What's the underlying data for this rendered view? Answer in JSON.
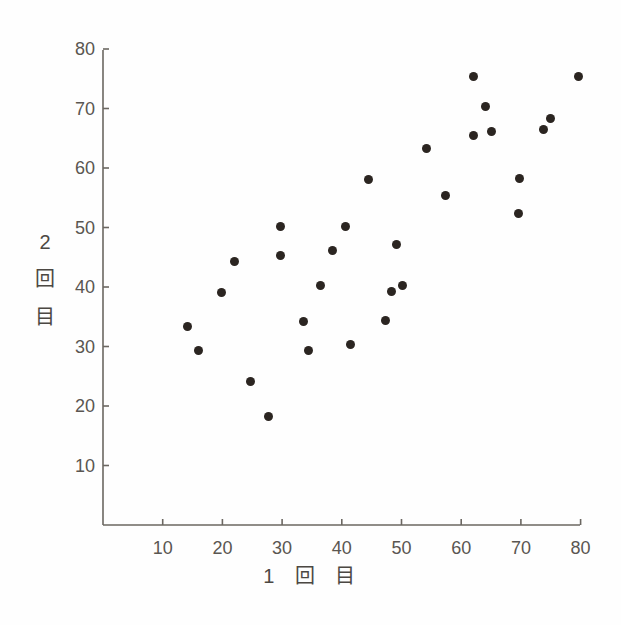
{
  "chart_data": {
    "type": "scatter",
    "title": "",
    "subtitle": "",
    "xlabel": "1 回 目",
    "ylabel": "2 回 目",
    "xlabel_segments": [
      "1",
      "回",
      "目"
    ],
    "ylabel_segments": [
      "2",
      "回",
      "目"
    ],
    "xlim": [
      0,
      82
    ],
    "ylim": [
      0,
      82
    ],
    "xticks": [
      10,
      20,
      30,
      40,
      50,
      60,
      70,
      80
    ],
    "yticks": [
      10,
      20,
      30,
      40,
      50,
      60,
      70,
      80
    ],
    "xticklabels": [
      "10",
      "20",
      "30",
      "40",
      "50",
      "60",
      "70",
      "80"
    ],
    "yticklabels": [
      "10",
      "20",
      "30",
      "40",
      "50",
      "60",
      "70",
      "80"
    ],
    "grid": false,
    "legend": false,
    "legend_position": "none",
    "marker": "circle",
    "marker_color": "#2b2521",
    "marker_size": 9,
    "axis_color": "#6b6761",
    "tick_label_color": "#5a5651",
    "background_color": "#fefefe",
    "n_points": 30,
    "points": [
      {
        "x": 14.1,
        "y": 33.4
      },
      {
        "x": 16.0,
        "y": 29.4
      },
      {
        "x": 19.8,
        "y": 39.1
      },
      {
        "x": 22.0,
        "y": 44.3
      },
      {
        "x": 24.7,
        "y": 24.2
      },
      {
        "x": 27.7,
        "y": 18.3
      },
      {
        "x": 29.7,
        "y": 50.2
      },
      {
        "x": 29.8,
        "y": 45.3
      },
      {
        "x": 33.6,
        "y": 34.2
      },
      {
        "x": 34.4,
        "y": 29.3
      },
      {
        "x": 36.4,
        "y": 40.2
      },
      {
        "x": 38.5,
        "y": 46.2
      },
      {
        "x": 40.7,
        "y": 50.2
      },
      {
        "x": 41.4,
        "y": 30.3
      },
      {
        "x": 44.4,
        "y": 58.1
      },
      {
        "x": 47.3,
        "y": 34.3
      },
      {
        "x": 49.1,
        "y": 47.2
      },
      {
        "x": 48.3,
        "y": 39.2
      },
      {
        "x": 50.1,
        "y": 40.3
      },
      {
        "x": 54.2,
        "y": 63.3
      },
      {
        "x": 57.3,
        "y": 55.3
      },
      {
        "x": 62.0,
        "y": 75.4
      },
      {
        "x": 62.0,
        "y": 65.4
      },
      {
        "x": 64.1,
        "y": 70.4
      },
      {
        "x": 65.0,
        "y": 66.2
      },
      {
        "x": 69.7,
        "y": 58.2
      },
      {
        "x": 69.6,
        "y": 52.3
      },
      {
        "x": 73.8,
        "y": 66.4
      },
      {
        "x": 74.9,
        "y": 68.4
      },
      {
        "x": 79.7,
        "y": 75.4
      }
    ]
  },
  "axes_geometry": {
    "origin_x_px": 103,
    "origin_y_px": 525,
    "px_per_unit_x": 5.97,
    "px_per_unit_y": 5.95,
    "y_axis_x_px": 103,
    "y_axis_top_px": 50,
    "x_axis_right_px": 580,
    "tick_length_px": 6
  }
}
